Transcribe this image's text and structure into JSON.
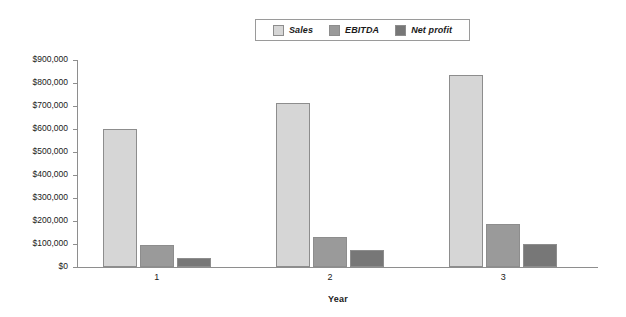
{
  "chart_data": {
    "type": "bar",
    "title": "",
    "subtitle": "",
    "xlabel": "Year",
    "ylabel": "",
    "categories": [
      "1",
      "2",
      "3"
    ],
    "ylim": [
      0,
      900000
    ],
    "ytick_step": 100000,
    "ytick_labels": [
      "$0",
      "$100,000",
      "$200,000",
      "$300,000",
      "$400,000",
      "$500,000",
      "$600,000",
      "$700,000",
      "$800,000",
      "$900,000"
    ],
    "grid": false,
    "legend_position": "top-center",
    "series": [
      {
        "name": "Sales",
        "color": "#d6d6d6",
        "values": [
          600000,
          715000,
          835000
        ]
      },
      {
        "name": "EBITDA",
        "color": "#9a9a9a",
        "values": [
          95000,
          130000,
          185000
        ]
      },
      {
        "name": "Net profit",
        "color": "#777777",
        "values": [
          40000,
          73000,
          100000
        ]
      }
    ]
  },
  "legend": {
    "items": [
      {
        "label": "Sales"
      },
      {
        "label": "EBITDA"
      },
      {
        "label": "Net profit"
      }
    ]
  },
  "axes": {
    "x_title": "Year",
    "x_categories": [
      "1",
      "2",
      "3"
    ],
    "y_ticks": [
      "$900,000",
      "$800,000",
      "$700,000",
      "$600,000",
      "$500,000",
      "$400,000",
      "$300,000",
      "$200,000",
      "$100,000",
      "$0"
    ]
  }
}
